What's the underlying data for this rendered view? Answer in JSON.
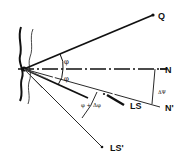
{
  "diagram": {
    "labels": {
      "Q": "Q",
      "N": "N",
      "N_prime": "N'",
      "LS": "LS",
      "LS_prime": "LS'",
      "phi_upper": "φ",
      "phi_lower": "φ",
      "phi_plus_delta_phi": "φ + Δφ",
      "delta_psi": "ΔΨ"
    },
    "colors": {
      "ink": "#111111",
      "background": "#ffffff"
    },
    "lines": [
      {
        "name": "ray-Q",
        "style": "solid-thick",
        "to": "Q"
      },
      {
        "name": "ray-N",
        "style": "dash-dot",
        "to": "N"
      },
      {
        "name": "ray-N-prime",
        "style": "solid-thin",
        "to": "N'"
      },
      {
        "name": "ray-LS",
        "style": "solid-thick",
        "to": "LS"
      },
      {
        "name": "ray-LS-prime",
        "style": "solid-thin",
        "to": "LS'"
      }
    ],
    "angles": [
      {
        "between": [
          "Q",
          "N"
        ],
        "label": "φ"
      },
      {
        "between": [
          "N",
          "LS"
        ],
        "label": "φ"
      },
      {
        "between": [
          "N'",
          "LS'"
        ],
        "label": "φ + Δφ"
      },
      {
        "between": [
          "N",
          "N'"
        ],
        "label": "ΔΨ"
      }
    ]
  }
}
